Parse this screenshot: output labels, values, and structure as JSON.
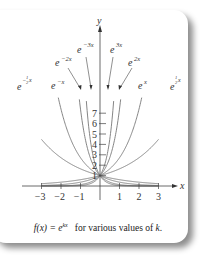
{
  "chart_data": {
    "type": "line",
    "title": "",
    "xlabel": "x",
    "ylabel": "y",
    "xlim": [
      -3,
      3
    ],
    "ylim": [
      0,
      7
    ],
    "x_ticks": [
      "−3",
      "−2",
      "−1",
      "1",
      "2",
      "3"
    ],
    "y_ticks": [
      "1",
      "2",
      "3",
      "4",
      "5",
      "6",
      "7"
    ],
    "series": [
      {
        "name": "e^{-3x}",
        "k": -3
      },
      {
        "name": "e^{-2x}",
        "k": -2
      },
      {
        "name": "e^{-x}",
        "k": -1
      },
      {
        "name": "e^{-1/2 x}",
        "k": -0.5
      },
      {
        "name": "e^{3x}",
        "k": 3
      },
      {
        "name": "e^{2x}",
        "k": 2
      },
      {
        "name": "e^{x}",
        "k": 1
      },
      {
        "name": "e^{1/2 x}",
        "k": 0.5
      }
    ],
    "caption": "f(x) = e^{kx} for various values of k."
  },
  "labels": {
    "y_axis": "y",
    "x_axis": "x",
    "e": "e",
    "neg3x": "−3x",
    "neg2x": "−2x",
    "negx": "−x",
    "neghalf": "−",
    "half_num": "1",
    "half_den": "2",
    "x": "x",
    "pos3x": "3x",
    "pos2x": "2x",
    "posx": "x"
  },
  "caption": {
    "fx": "f(x) = e",
    "kx": "kx",
    "rest": "for various values of ",
    "k": "k",
    "end": "."
  }
}
